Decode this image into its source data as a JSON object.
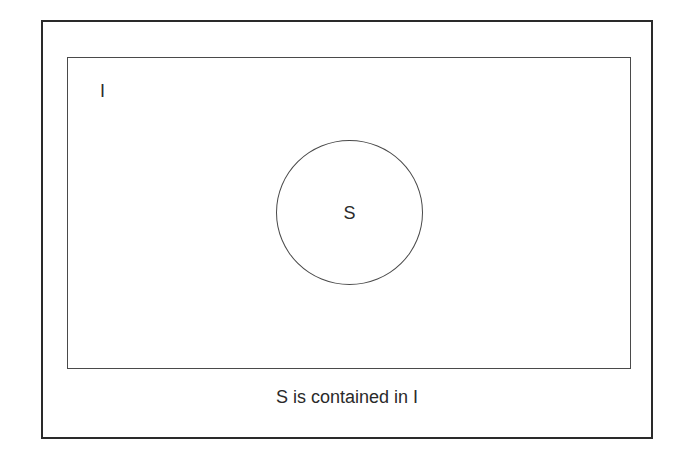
{
  "diagram": {
    "type": "venn-subset",
    "universe": {
      "label": "I"
    },
    "subset": {
      "label": "S"
    },
    "caption": "S is contained in I",
    "colors": {
      "frame": "#2a2a2a",
      "lines": "#4a4a4a",
      "text": "#2a2a2a",
      "background": "#ffffff"
    }
  }
}
